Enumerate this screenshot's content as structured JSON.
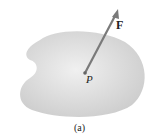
{
  "figure": {
    "force_label": "F",
    "point_label": "P",
    "caption": "(a)",
    "colors": {
      "body": "#dcdcdc",
      "arrow": "#7a7a7a",
      "point": "#666666"
    }
  }
}
